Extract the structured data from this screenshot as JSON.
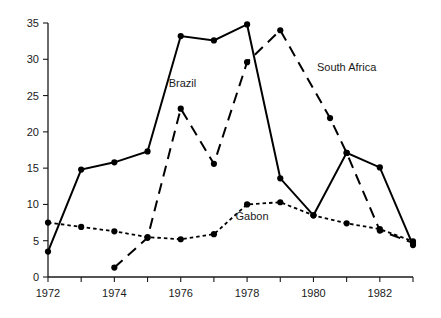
{
  "chart_data": {
    "type": "line",
    "title": "",
    "subtitle": "",
    "xlabel": "",
    "ylabel": "",
    "xlim": [
      1972,
      1983
    ],
    "ylim": [
      0,
      35
    ],
    "grid": false,
    "legend_position": "inline-annotations",
    "x": [
      1972,
      1973,
      1974,
      1975,
      1976,
      1977,
      1978,
      1979,
      1980,
      1981,
      1982,
      1983
    ],
    "x_tick_labels": [
      "1972",
      "",
      "1974",
      "",
      "1976",
      "",
      "1978",
      "",
      "1980",
      "",
      "1982",
      ""
    ],
    "x_tick_values": [
      1972,
      1973,
      1974,
      1975,
      1976,
      1977,
      1978,
      1979,
      1980,
      1981,
      1982,
      1983
    ],
    "y_tick_labels": [
      "0",
      "5",
      "10",
      "15",
      "20",
      "25",
      "30",
      "35"
    ],
    "y_tick_values": [
      0,
      5,
      10,
      15,
      20,
      25,
      30,
      35
    ],
    "series": [
      {
        "name": "Brazil",
        "style": "solid",
        "color": "#000000",
        "marker": "filled-circle",
        "label_x": 1976.05,
        "label_y": 26.2,
        "points": [
          {
            "x": 1972,
            "y": 3.5
          },
          {
            "x": 1973,
            "y": 14.8
          },
          {
            "x": 1974,
            "y": 15.8
          },
          {
            "x": 1975,
            "y": 17.3
          },
          {
            "x": 1976,
            "y": 33.2
          },
          {
            "x": 1977,
            "y": 32.6
          },
          {
            "x": 1978,
            "y": 34.8
          },
          {
            "x": 1979,
            "y": 13.6
          },
          {
            "x": 1980,
            "y": 8.5
          },
          {
            "x": 1981,
            "y": 17.1
          },
          {
            "x": 1982,
            "y": 15.1
          },
          {
            "x": 1983,
            "y": 4.4
          }
        ]
      },
      {
        "name": "South Africa",
        "style": "dashed",
        "color": "#000000",
        "marker": "filled-circle",
        "label_x": 1981.0,
        "label_y": 28.4,
        "points": [
          {
            "x": 1974,
            "y": 1.3
          },
          {
            "x": 1975,
            "y": 5.4
          },
          {
            "x": 1976,
            "y": 23.2
          },
          {
            "x": 1977,
            "y": 15.6
          },
          {
            "x": 1978,
            "y": 29.6
          },
          {
            "x": 1979,
            "y": 34.0
          },
          {
            "x": 1980.5,
            "y": 21.9
          },
          {
            "x": 1981,
            "y": 17.1
          },
          {
            "x": 1982,
            "y": 6.4
          },
          {
            "x": 1983,
            "y": 4.7
          }
        ]
      },
      {
        "name": "Gabon",
        "style": "dotted",
        "color": "#000000",
        "marker": "filled-circle",
        "label_x": 1978.15,
        "label_y": 7.9,
        "points": [
          {
            "x": 1972,
            "y": 7.5
          },
          {
            "x": 1973,
            "y": 6.9
          },
          {
            "x": 1974,
            "y": 6.3
          },
          {
            "x": 1975,
            "y": 5.5
          },
          {
            "x": 1976,
            "y": 5.2
          },
          {
            "x": 1977,
            "y": 5.9
          },
          {
            "x": 1978,
            "y": 10.0
          },
          {
            "x": 1979,
            "y": 10.3
          },
          {
            "x": 1980,
            "y": 8.5
          },
          {
            "x": 1981,
            "y": 7.4
          },
          {
            "x": 1982,
            "y": 6.6
          },
          {
            "x": 1983,
            "y": 4.9
          }
        ]
      }
    ]
  }
}
